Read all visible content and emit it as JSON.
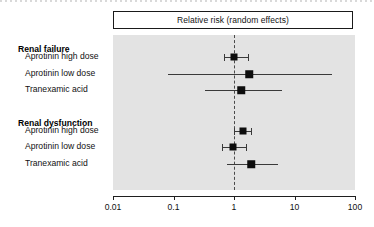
{
  "chart_data": {
    "type": "forest",
    "title": "Relative risk (random effects)",
    "xlabel": "",
    "ylabel": "",
    "xscale": "log",
    "xlim": [
      0.01,
      100
    ],
    "xticks": [
      0.01,
      0.1,
      1,
      10,
      100
    ],
    "xtick_labels": [
      "0.01",
      "0.1",
      "1",
      "10",
      "100"
    ],
    "null_value": 1,
    "grid": false,
    "legend": "none",
    "panel_background": "#e3e3e3",
    "marker_color": "#0d0d0d",
    "line_color": "#3a3a3a",
    "groups": [
      {
        "label": "Renal failure",
        "rows": [
          {
            "label": "Aprotinin high dose",
            "rr": 1.0,
            "ci_low": 0.68,
            "ci_high": 1.73,
            "marker_size": 7
          },
          {
            "label": "Aprotinin low dose",
            "rr": 1.77,
            "ci_low": 0.08,
            "ci_high": 42.0,
            "marker_size": 7.5
          },
          {
            "label": "Tranexamic acid",
            "rr": 1.32,
            "ci_low": 0.33,
            "ci_high": 6.3,
            "marker_size": 7.5
          }
        ]
      },
      {
        "label": "Renal dysfunction",
        "rows": [
          {
            "label": "Aprotinin high dose",
            "rr": 1.4,
            "ci_low": 0.99,
            "ci_high": 1.9,
            "marker_size": 7
          },
          {
            "label": "Aprotinin low dose",
            "rr": 0.97,
            "ci_low": 0.64,
            "ci_high": 1.55,
            "marker_size": 7
          },
          {
            "label": "Tranexamic acid",
            "rr": 1.92,
            "ci_low": 0.78,
            "ci_high": 5.4,
            "marker_size": 7.5
          }
        ]
      }
    ]
  },
  "layout": {
    "panel": {
      "left": 113,
      "top": 35,
      "width": 242,
      "height": 155
    },
    "axis_left_value": 0.01,
    "axis_right_value": 100,
    "row_y": [
      57,
      74,
      90,
      131,
      147,
      164
    ],
    "group_heading_y": [
      44,
      118
    ]
  }
}
